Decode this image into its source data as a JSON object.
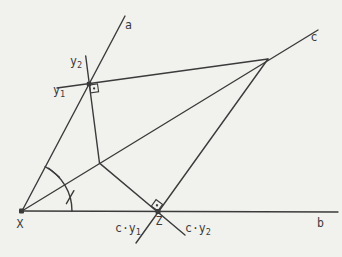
{
  "figure": {
    "width": 342,
    "height": 257,
    "background": "#f1f1ee",
    "ink": "#3b3b3b",
    "stroke_width": 1.4,
    "label_font_size": 11.5,
    "sub_font_size": 8.5,
    "lines": [
      {
        "name": "line-b",
        "x1": 22,
        "y1": 211,
        "x2": 338,
        "y2": 212
      },
      {
        "name": "line-a",
        "x1": 22,
        "y1": 211,
        "x2": 125,
        "y2": 16
      },
      {
        "name": "line-c",
        "x1": 22,
        "y1": 211,
        "x2": 318,
        "y2": 30
      },
      {
        "name": "segment-y1-to-apex",
        "x1": 57,
        "y1": 88,
        "x2": 268,
        "y2": 59
      },
      {
        "name": "segment-y2-to-junction",
        "x1": 85.7,
        "y1": 56,
        "x2": 99.5,
        "y2": 163.1
      },
      {
        "name": "segment-junction-to-cy2",
        "x1": 99.5,
        "y1": 163.1,
        "x2": 185,
        "y2": 235
      },
      {
        "name": "segment-apex-to-cy1",
        "x1": 268,
        "y1": 59,
        "x2": 136,
        "y2": 243
      }
    ],
    "dots": [
      {
        "name": "point-X",
        "x": 21.5,
        "y": 211,
        "size": 5
      },
      {
        "name": "point-y",
        "x": 89,
        "y": 84,
        "size": 4.5
      },
      {
        "name": "point-Z",
        "x": 158,
        "y": 211.5,
        "size": 5
      }
    ],
    "right_angle_marks": [
      {
        "name": "right-angle-y-point",
        "x": 89,
        "y": 84.5,
        "rotate": -8,
        "dx": 0.5,
        "dy": 0.5,
        "size": 8
      },
      {
        "name": "right-angle-Z",
        "x": 158,
        "y": 211.5,
        "rotate": -54.3,
        "dx": 0.5,
        "dy": -8.5,
        "size": 8
      }
    ],
    "angle_arc": {
      "cx": 22,
      "cy": 211,
      "r": 50,
      "start_deg": -62.5,
      "end_deg": 0.5,
      "ticks": [
        {
          "name": "angle-tick-upper",
          "x1": 48.7,
          "y1": 168.2,
          "x2": 59.5,
          "y2": 177.2
        },
        {
          "name": "angle-tick-lower",
          "x1": 66.4,
          "y1": 203.7,
          "x2": 73.9,
          "y2": 190.7
        }
      ]
    },
    "labels": [
      {
        "name": "label-line-a",
        "text": "a",
        "sub": "",
        "x": 125,
        "y": 29
      },
      {
        "name": "label-line-b",
        "text": "b",
        "sub": "",
        "x": 317,
        "y": 227
      },
      {
        "name": "label-line-c",
        "text": "c",
        "sub": "",
        "x": 310.5,
        "y": 41
      },
      {
        "name": "label-point-X",
        "text": "X",
        "sub": "",
        "x": 16.5,
        "y": 228
      },
      {
        "name": "label-point-Z",
        "text": "Z",
        "sub": "",
        "x": 155.5,
        "y": 225
      },
      {
        "name": "label-y2",
        "text": "y",
        "sub": "2",
        "x": 70,
        "y": 65
      },
      {
        "name": "label-y1",
        "text": "y",
        "sub": "1",
        "x": 53,
        "y": 94
      },
      {
        "name": "label-c-y1",
        "text": "c·y",
        "sub": "1",
        "x": 115,
        "y": 232
      },
      {
        "name": "label-c-y2",
        "text": "c·y",
        "sub": "2",
        "x": 185,
        "y": 232
      }
    ]
  }
}
